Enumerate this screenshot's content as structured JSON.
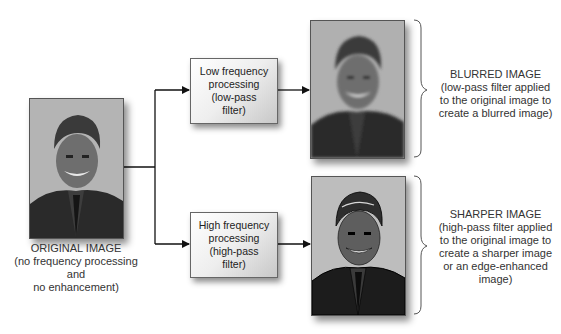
{
  "original": {
    "title": "ORIGINAL IMAGE",
    "lines": [
      "(no frequency processing",
      "and",
      "no enhancement)"
    ],
    "photo": "portrait-original"
  },
  "processes": [
    {
      "lines": [
        "Low frequency",
        "processing",
        "(low-pass",
        "filter)"
      ]
    },
    {
      "lines": [
        "High frequency",
        "processing",
        "(high-pass",
        "filter)"
      ]
    }
  ],
  "results": [
    {
      "title": "BLURRED IMAGE",
      "lines": [
        "(low-pass filter applied",
        "to the original image to",
        "create a blurred image)"
      ],
      "photo": "portrait-blurred"
    },
    {
      "title": "SHARPER IMAGE",
      "lines": [
        "(high-pass filter applied",
        "to the original image to",
        "create a sharper image",
        "or an edge-enhanced",
        "image)"
      ],
      "photo": "portrait-sharpened"
    }
  ],
  "colors": {
    "line": "#111111",
    "brace": "#555555",
    "box_border": "#666666"
  }
}
